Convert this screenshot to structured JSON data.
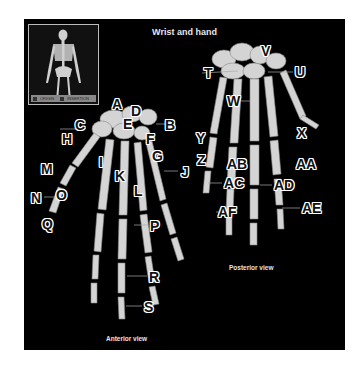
{
  "figure": {
    "title": "Wrist and hand",
    "legend": {
      "origin": "ORIGIN",
      "insertion": "INSERTION"
    },
    "anterior_view_label": "Anterior view",
    "posterior_view_label": "Posterior view",
    "colors": {
      "background": "#000000",
      "bone": "#d9d9d9",
      "label_fill": "#111111",
      "label_outline": "#ffffff"
    }
  },
  "labels": {
    "anterior": [
      {
        "id": "A",
        "x": 88,
        "y": 78
      },
      {
        "id": "B",
        "x": 141,
        "y": 99
      },
      {
        "id": "C",
        "x": 51,
        "y": 99
      },
      {
        "id": "D",
        "x": 107,
        "y": 85
      },
      {
        "id": "E",
        "x": 99,
        "y": 98
      },
      {
        "id": "F",
        "x": 122,
        "y": 113
      },
      {
        "id": "G",
        "x": 128,
        "y": 130
      },
      {
        "id": "H",
        "x": 38,
        "y": 113
      },
      {
        "id": "I",
        "x": 75,
        "y": 136
      },
      {
        "id": "J",
        "x": 157,
        "y": 146
      },
      {
        "id": "K",
        "x": 91,
        "y": 150
      },
      {
        "id": "L",
        "x": 110,
        "y": 165
      },
      {
        "id": "M",
        "x": 17,
        "y": 143
      },
      {
        "id": "N",
        "x": 7,
        "y": 172
      },
      {
        "id": "O",
        "x": 32,
        "y": 169
      },
      {
        "id": "P",
        "x": 126,
        "y": 200
      },
      {
        "id": "Q",
        "x": 18,
        "y": 198
      },
      {
        "id": "R",
        "x": 125,
        "y": 251
      },
      {
        "id": "S",
        "x": 120,
        "y": 281
      }
    ],
    "posterior": [
      {
        "id": "T",
        "x": 180,
        "y": 47
      },
      {
        "id": "U",
        "x": 271,
        "y": 46
      },
      {
        "id": "V",
        "x": 237,
        "y": 25
      },
      {
        "id": "W",
        "x": 203,
        "y": 75
      },
      {
        "id": "X",
        "x": 273,
        "y": 107
      },
      {
        "id": "Y",
        "x": 172,
        "y": 112
      },
      {
        "id": "Z",
        "x": 173,
        "y": 134
      },
      {
        "id": "AA",
        "x": 272,
        "y": 138
      },
      {
        "id": "AB",
        "x": 203,
        "y": 138
      },
      {
        "id": "AC",
        "x": 200,
        "y": 157
      },
      {
        "id": "AD",
        "x": 250,
        "y": 159
      },
      {
        "id": "AE",
        "x": 278,
        "y": 182
      },
      {
        "id": "AF",
        "x": 194,
        "y": 186
      }
    ]
  }
}
